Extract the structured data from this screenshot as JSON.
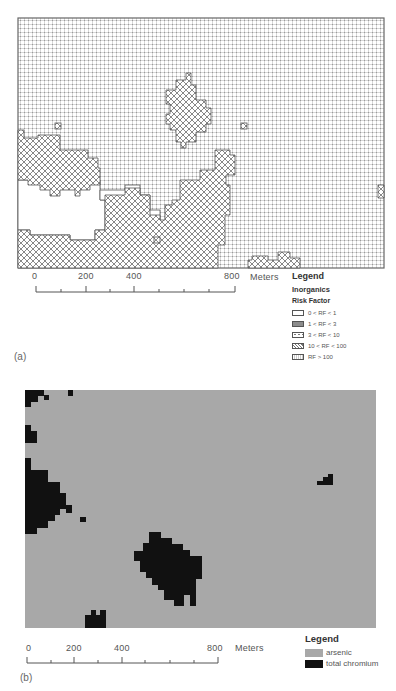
{
  "figure": {
    "panel_a": {
      "label": "(a)",
      "legend": {
        "title": "Legend",
        "subtitle": "Inorganics",
        "heading": "Risk Factor",
        "items": [
          {
            "label": "0 < RF < 1",
            "pattern": "white"
          },
          {
            "label": "1 < RF < 3",
            "pattern": "gray-fill"
          },
          {
            "label": "3 < RF < 10",
            "pattern": "sparse-dots"
          },
          {
            "label": "10 < RF < 100",
            "pattern": "crosshatch"
          },
          {
            "label": "RF > 100",
            "pattern": "dense-dot-grid"
          }
        ]
      },
      "scale_bar": {
        "ticks": [
          "0",
          "200",
          "400",
          "800"
        ],
        "unit": "Meters"
      }
    },
    "panel_b": {
      "label": "(b)",
      "legend": {
        "title": "Legend",
        "items": [
          {
            "label": "arsenic",
            "color": "#a8a8a8"
          },
          {
            "label": "total chromium",
            "color": "#111111"
          }
        ]
      },
      "scale_bar": {
        "ticks": [
          "0",
          "200",
          "400",
          "800"
        ],
        "unit": "Meters"
      }
    }
  },
  "colors": {
    "arsenic": "#a8a8a8",
    "chromium": "#111111",
    "frame": "#666666",
    "crosshatch_stroke": "#777777",
    "dot_grid": "#c8c8c8"
  }
}
